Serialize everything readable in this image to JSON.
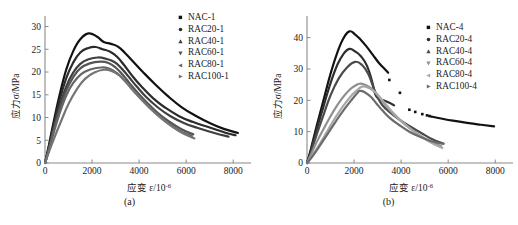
{
  "figure": {
    "panels": [
      {
        "id": "a",
        "caption": "(a)",
        "xlabel_main": "应变 ε/10",
        "xlabel_sup": "-6",
        "ylabel": "应力σ/MPa",
        "xticks": [
          "0",
          "2000",
          "4000",
          "6000",
          "8000"
        ],
        "yticks": [
          "0",
          "5",
          "10",
          "15",
          "20",
          "25",
          "30"
        ],
        "legend": [
          {
            "label": "NAC-1",
            "marker": "square",
            "color": "#121212"
          },
          {
            "label": "RAC20-1",
            "marker": "circle",
            "color": "#2b2b2b"
          },
          {
            "label": "RAC40-1",
            "marker": "triangle-up",
            "color": "#3f3f3f"
          },
          {
            "label": "RAC60-1",
            "marker": "triangle-down",
            "color": "#555555"
          },
          {
            "label": "RAC80-1",
            "marker": "triangle-left",
            "color": "#666666"
          },
          {
            "label": "RAC100-1",
            "marker": "triangle-right",
            "color": "#757575"
          }
        ]
      },
      {
        "id": "b",
        "caption": "(b)",
        "xlabel_main": "应变 ε/10",
        "xlabel_sup": "-6",
        "ylabel": "应力σ/MPa",
        "xticks": [
          "0",
          "2000",
          "4000",
          "6000",
          "8000"
        ],
        "yticks": [
          "0",
          "10",
          "20",
          "30",
          "40"
        ],
        "legend": [
          {
            "label": "NAC-4",
            "marker": "square",
            "color": "#121212"
          },
          {
            "label": "RAC20-4",
            "marker": "circle",
            "color": "#2e2e2e"
          },
          {
            "label": "RAC40-4",
            "marker": "triangle-up",
            "color": "#4a4a4a"
          },
          {
            "label": "RAC60-4",
            "marker": "triangle-down",
            "color": "#8f8f8f"
          },
          {
            "label": "RAC80-4",
            "marker": "triangle-left",
            "color": "#a8a8a8"
          },
          {
            "label": "RAC100-4",
            "marker": "triangle-right",
            "color": "#6b6b6b"
          }
        ]
      }
    ]
  },
  "chart_data": [
    {
      "type": "line",
      "panel": "a",
      "title": "",
      "xlabel": "应变 ε/10^-6",
      "ylabel": "应力σ/MPa",
      "xlim": [
        0,
        8500
      ],
      "ylim": [
        0,
        31
      ],
      "xticks": [
        0,
        2000,
        4000,
        6000,
        8000
      ],
      "yticks": [
        0,
        5,
        10,
        15,
        20,
        25,
        30
      ],
      "grid": false,
      "legend_position": "top-right",
      "series": [
        {
          "name": "NAC-1",
          "color": "#121212",
          "peak": {
            "x": 1850,
            "y": 28.5
          },
          "x": [
            0,
            150,
            350,
            600,
            900,
            1200,
            1500,
            1850,
            2200,
            2500,
            2800,
            3100,
            3400,
            3800,
            4200,
            4700,
            5200,
            5800,
            6400,
            7000,
            7600,
            8200
          ],
          "y": [
            0,
            3.5,
            8.6,
            14.5,
            20.5,
            24.6,
            27.2,
            28.5,
            27.8,
            26.6,
            26.2,
            25.6,
            24.2,
            22.0,
            19.8,
            17.2,
            14.8,
            12.3,
            10.4,
            8.8,
            7.5,
            6.6
          ]
        },
        {
          "name": "RAC20-1",
          "color": "#2b2b2b",
          "peak": {
            "x": 2150,
            "y": 25.5
          },
          "x": [
            0,
            150,
            350,
            600,
            900,
            1200,
            1500,
            1850,
            2150,
            2450,
            2750,
            3050,
            3350,
            3700,
            4100,
            4600,
            5100,
            5700,
            6300,
            7000,
            7700,
            8100
          ],
          "y": [
            0,
            3.2,
            8.0,
            13.4,
            18.6,
            22.1,
            24.3,
            25.3,
            25.5,
            25.0,
            24.5,
            23.4,
            21.6,
            19.2,
            16.8,
            14.2,
            12.2,
            10.3,
            9.0,
            7.8,
            6.6,
            6.1
          ]
        },
        {
          "name": "RAC40-1",
          "color": "#3f3f3f",
          "peak": {
            "x": 2250,
            "y": 23.2
          },
          "x": [
            0,
            150,
            350,
            600,
            900,
            1200,
            1500,
            1850,
            2250,
            2600,
            2950,
            3250,
            3550,
            3900,
            4300,
            4800,
            5300,
            5900,
            6500,
            7200,
            7800
          ],
          "y": [
            0,
            2.9,
            7.2,
            12.1,
            16.8,
            19.9,
            21.8,
            22.8,
            23.2,
            22.9,
            22.2,
            20.8,
            19.0,
            16.8,
            14.5,
            12.2,
            10.4,
            8.8,
            7.7,
            6.6,
            5.8
          ]
        },
        {
          "name": "RAC60-1",
          "color": "#555555",
          "peak": {
            "x": 2350,
            "y": 22.3
          },
          "x": [
            0,
            150,
            350,
            600,
            900,
            1200,
            1500,
            1900,
            2350,
            2700,
            3000,
            3300,
            3600,
            3950,
            4350,
            4800,
            5250,
            5800,
            6300
          ],
          "y": [
            0,
            2.7,
            6.8,
            11.4,
            15.9,
            18.9,
            20.8,
            21.9,
            22.3,
            22.0,
            21.0,
            19.4,
            17.5,
            15.4,
            13.2,
            11.0,
            9.2,
            7.4,
            6.3
          ]
        },
        {
          "name": "RAC80-1",
          "color": "#666666",
          "peak": {
            "x": 2400,
            "y": 21.0
          },
          "x": [
            0,
            150,
            350,
            600,
            900,
            1200,
            1550,
            1950,
            2400,
            2750,
            3050,
            3350,
            3650,
            4000,
            4400,
            4850,
            5300,
            5800,
            6250
          ],
          "y": [
            0,
            2.5,
            6.3,
            10.6,
            14.8,
            17.6,
            19.6,
            20.6,
            21.0,
            20.7,
            19.8,
            18.3,
            16.5,
            14.5,
            12.4,
            10.3,
            8.5,
            6.9,
            5.9
          ]
        },
        {
          "name": "RAC100-1",
          "color": "#757575",
          "peak": {
            "x": 2500,
            "y": 20.5
          },
          "x": [
            0,
            150,
            400,
            700,
            1000,
            1350,
            1700,
            2100,
            2500,
            2850,
            3150,
            3450,
            3750,
            4100,
            4500,
            4950,
            5400,
            5900,
            6350
          ],
          "y": [
            0,
            2.2,
            5.6,
            9.4,
            13.0,
            16.2,
            18.5,
            19.9,
            20.5,
            20.2,
            19.3,
            17.8,
            16.0,
            14.0,
            11.9,
            9.8,
            8.0,
            6.4,
            5.4
          ]
        }
      ]
    },
    {
      "type": "line",
      "panel": "b",
      "title": "",
      "xlabel": "应变 ε/10^-6",
      "ylabel": "应力σ/MPa",
      "xlim": [
        0,
        8500
      ],
      "ylim": [
        0,
        45
      ],
      "xticks": [
        0,
        2000,
        4000,
        6000,
        8000
      ],
      "yticks": [
        0,
        10,
        20,
        30,
        40
      ],
      "grid": false,
      "legend_position": "top-right",
      "series": [
        {
          "name": "NAC-4",
          "color": "#121212",
          "peak": {
            "x": 1800,
            "y": 42.0
          },
          "x": [
            0,
            150,
            400,
            700,
            1000,
            1300,
            1550,
            1800,
            2050,
            2300,
            2550,
            2800,
            3050,
            3300,
            3450
          ],
          "y": [
            0,
            4.0,
            11.5,
            20.0,
            28.5,
            35.5,
            39.8,
            42.0,
            41.0,
            39.2,
            37.0,
            34.5,
            32.0,
            30.0,
            28.8
          ],
          "dots_x": [
            3500,
            3950,
            4350,
            4600,
            4900,
            5100,
            5200
          ],
          "dots_y": [
            26.5,
            22.4,
            17.0,
            16.3,
            15.6,
            15.2,
            15.0
          ],
          "tail_x": [
            5250,
            5700,
            6200,
            6800,
            7400,
            7950
          ],
          "tail_y": [
            14.9,
            14.2,
            13.5,
            12.8,
            12.2,
            11.7
          ]
        },
        {
          "name": "RAC20-4",
          "color": "#2e2e2e",
          "peak": {
            "x": 1800,
            "y": 36.4
          },
          "x": [
            0,
            150,
            400,
            700,
            1000,
            1300,
            1550,
            1800,
            2050,
            2300,
            2550,
            2750,
            2900,
            3050,
            3250,
            3500,
            3700
          ],
          "y": [
            0,
            3.6,
            10.4,
            18.0,
            25.5,
            31.5,
            34.8,
            36.4,
            35.6,
            34.0,
            31.0,
            26.5,
            22.0,
            20.5,
            20.0,
            19.2,
            18.4
          ]
        },
        {
          "name": "RAC40-4",
          "color": "#4a4a4a",
          "peak": {
            "x": 2050,
            "y": 32.3
          },
          "x": [
            0,
            150,
            400,
            700,
            1000,
            1350,
            1700,
            2050,
            2350,
            2600,
            2800,
            3000,
            3200,
            3500,
            3900,
            4350,
            4850,
            5350,
            5800
          ],
          "y": [
            0,
            3.0,
            8.8,
            15.3,
            21.6,
            27.0,
            30.5,
            32.3,
            31.2,
            28.5,
            24.6,
            21.0,
            18.5,
            16.3,
            14.0,
            11.8,
            9.6,
            7.5,
            6.2
          ]
        },
        {
          "name": "RAC60-4",
          "color": "#8f8f8f",
          "peak": {
            "x": 2250,
            "y": 25.3
          },
          "x": [
            0,
            150,
            400,
            750,
            1100,
            1450,
            1800,
            2100,
            2250,
            2450,
            2700,
            2950,
            3200,
            3500,
            3900,
            4350,
            4800,
            5250,
            5700
          ],
          "y": [
            0,
            2.3,
            6.5,
            11.5,
            16.2,
            20.2,
            23.3,
            24.9,
            25.3,
            25.0,
            24.0,
            22.2,
            19.8,
            17.0,
            14.0,
            11.2,
            8.8,
            6.8,
            5.4
          ]
        },
        {
          "name": "RAC80-4",
          "color": "#a8a8a8",
          "peak": {
            "x": 2350,
            "y": 24.4
          },
          "x": [
            0,
            200,
            500,
            850,
            1200,
            1550,
            1900,
            2200,
            2350,
            2550,
            2800,
            3050,
            3300,
            3600,
            4000,
            4450,
            4900,
            5350,
            5750
          ],
          "y": [
            0,
            2.0,
            5.6,
            10.0,
            14.4,
            18.3,
            21.6,
            23.7,
            24.4,
            24.2,
            23.2,
            21.4,
            19.2,
            16.5,
            13.5,
            10.6,
            8.2,
            6.2,
            4.8
          ]
        },
        {
          "name": "RAC100-4",
          "color": "#6b6b6b",
          "peak": {
            "x": 2250,
            "y": 23.0
          },
          "x": [
            0,
            200,
            500,
            850,
            1200,
            1550,
            1900,
            2150,
            2250,
            2450,
            2700,
            2950,
            3200,
            3500,
            3900,
            4350,
            4850,
            5350,
            5800
          ],
          "y": [
            0,
            1.8,
            5.0,
            9.0,
            13.0,
            16.8,
            20.2,
            22.4,
            23.0,
            22.6,
            21.2,
            19.0,
            16.8,
            14.5,
            12.2,
            10.0,
            8.2,
            6.8,
            6.1
          ]
        }
      ]
    }
  ]
}
